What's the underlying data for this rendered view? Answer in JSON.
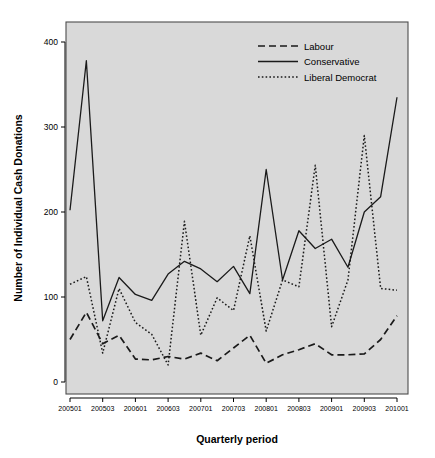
{
  "chart_data": {
    "type": "line",
    "title": "",
    "xlabel": "Quarterly period",
    "ylabel": "Number of Individual Cash Donations",
    "ylim": [
      0,
      420
    ],
    "yticks": [
      0,
      100,
      200,
      300,
      400
    ],
    "ytick_labels": [
      "0",
      "100",
      "200",
      "300",
      "400"
    ],
    "grid": false,
    "legend_position": "top-right",
    "plot_background": "#d9d9d9",
    "line_color": "#1a1a1a",
    "x": [
      "200501",
      "200502",
      "200503",
      "200504",
      "200601",
      "200602",
      "200603",
      "200604",
      "200701",
      "200702",
      "200703",
      "200704",
      "200801",
      "200802",
      "200803",
      "200804",
      "200901",
      "200902",
      "200903",
      "200904",
      "201001"
    ],
    "xticks": [
      "200501",
      "200503",
      "200601",
      "200603",
      "200701",
      "200703",
      "200801",
      "200803",
      "200901",
      "200903",
      "201001"
    ],
    "xtick_indices": [
      0,
      2,
      4,
      6,
      8,
      10,
      12,
      14,
      16,
      18,
      20
    ],
    "series": [
      {
        "name": "Labour",
        "style": "dashed",
        "values": [
          50,
          82,
          45,
          55,
          27,
          26,
          30,
          27,
          34,
          25,
          40,
          55,
          22,
          32,
          38,
          45,
          32,
          32,
          33,
          50,
          78
        ]
      },
      {
        "name": "Conservative",
        "style": "solid",
        "values": [
          202,
          378,
          72,
          123,
          103,
          96,
          127,
          142,
          133,
          118,
          136,
          104,
          250,
          120,
          178,
          157,
          168,
          135,
          200,
          218,
          335
        ]
      },
      {
        "name": "Liberal Democrat",
        "style": "dotted",
        "values": [
          115,
          124,
          34,
          110,
          70,
          56,
          20,
          189,
          55,
          99,
          84,
          172,
          60,
          120,
          112,
          255,
          65,
          120,
          290,
          110,
          108
        ]
      }
    ]
  },
  "legend": {
    "items": [
      {
        "label": "Labour",
        "style": "dashed"
      },
      {
        "label": "Conservative",
        "style": "solid"
      },
      {
        "label": "Liberal Democrat",
        "style": "dotted"
      }
    ]
  },
  "axes": {
    "x_title": "Quarterly period",
    "y_title": "Number of Individual Cash Donations"
  }
}
